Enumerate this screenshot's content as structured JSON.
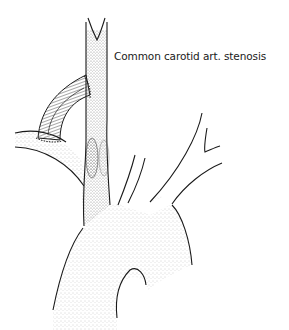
{
  "figure": {
    "label": "Common carotid art. stenosis",
    "colors": {
      "ink": "#1a1a1a",
      "stipple": "#555555",
      "background": "#ffffff"
    },
    "structures": [
      "aortic-arch",
      "common-carotid-artery",
      "carotid-bifurcation",
      "subclavian-artery",
      "bypass-graft",
      "stenosis",
      "arch-branch-vessels"
    ]
  }
}
